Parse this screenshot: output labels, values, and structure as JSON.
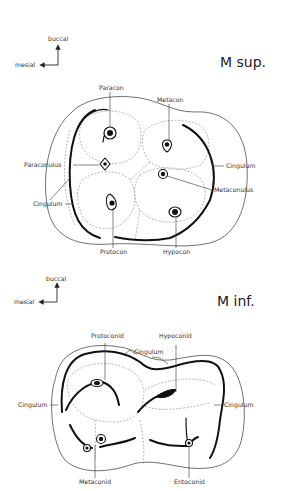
{
  "upper": {
    "title": "M sup.",
    "compass": {
      "buccal": "buccal",
      "mesial": "mesial"
    },
    "labels": {
      "paracon": "Paracon",
      "metacon": "Metacon",
      "paraconulus": "Paraconulus",
      "cingulum_right": "Cingulum",
      "metaconulus": "Metaconulus",
      "cingulum_left": "Cingulum",
      "protocon": "Protocon",
      "hypocon": "Hypocon"
    }
  },
  "lower": {
    "title": "M inf.",
    "compass": {
      "buccal": "buccal",
      "mesial": "mesial"
    },
    "labels": {
      "protoconid": "Protoconid",
      "hypoconid": "Hypoconid",
      "cingulum_top": "Cingulum",
      "cingulum_left": "Cingulum",
      "cingulum_right": "Cingulum",
      "metaconid": "Metaconid",
      "entoconid": "Entoconid"
    }
  }
}
